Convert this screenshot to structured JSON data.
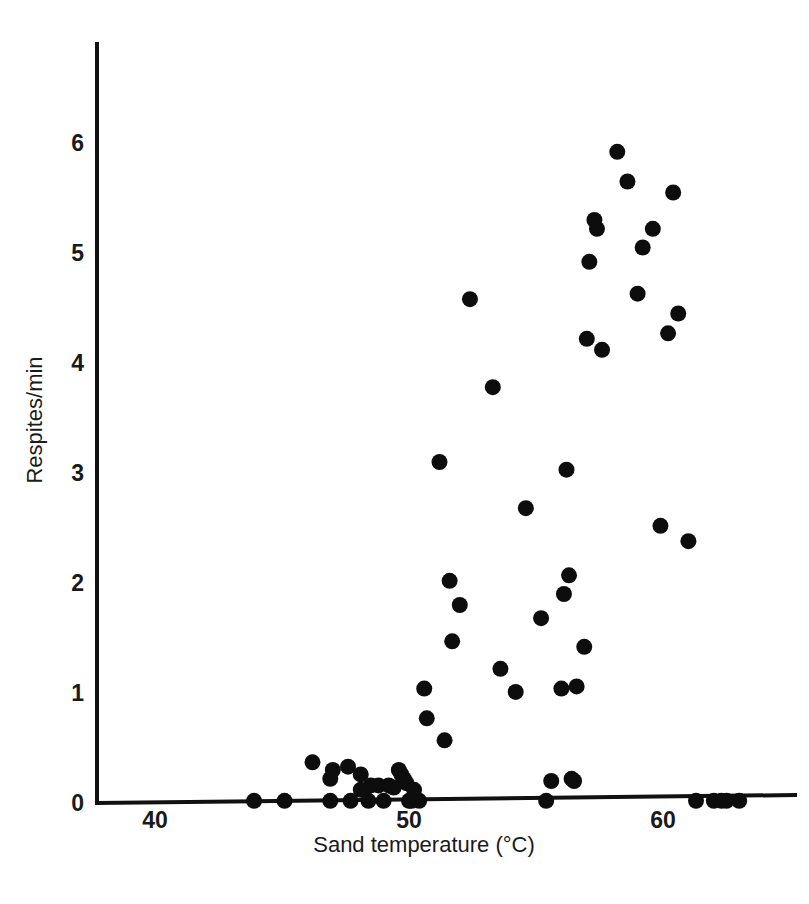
{
  "chart_data": {
    "type": "scatter",
    "title": "",
    "xlabel": "Sand temperature (°C)",
    "ylabel": "Respites/min",
    "xlim": [
      35.4,
      65.8
    ],
    "ylim": [
      -0.06,
      6.5
    ],
    "xticks": [
      40,
      50,
      60
    ],
    "xticklabels": [
      "40",
      "50",
      "60"
    ],
    "yticks": [
      0,
      1,
      2,
      3,
      4,
      5,
      6
    ],
    "yticklabels": [
      "0",
      "1",
      "2",
      "3",
      "4",
      "5",
      "6"
    ],
    "grid": false,
    "legend": null,
    "marker": {
      "shape": "circle",
      "color": "#0d0d0d",
      "size_px": 16
    },
    "x": [
      43.9,
      45.1,
      46.2,
      46.9,
      46.9,
      47.0,
      47.6,
      47.7,
      48.1,
      48.1,
      48.4,
      48.5,
      48.8,
      49.0,
      49.2,
      49.4,
      49.6,
      49.7,
      49.8,
      49.9,
      50.0,
      50.1,
      50.2,
      50.4,
      50.6,
      50.7,
      51.2,
      51.4,
      51.6,
      51.7,
      52.0,
      52.4,
      53.3,
      53.6,
      54.2,
      54.6,
      55.2,
      55.4,
      55.6,
      56.0,
      56.1,
      56.2,
      56.3,
      56.4,
      56.5,
      56.6,
      56.9,
      57.0,
      57.1,
      57.3,
      57.4,
      57.6,
      58.2,
      58.6,
      59.0,
      59.2,
      59.6,
      59.9,
      60.2,
      60.4,
      60.6,
      61.0,
      61.3,
      62.0,
      62.3,
      62.5,
      63.0
    ],
    "y": [
      0.02,
      0.02,
      0.37,
      0.22,
      0.02,
      0.3,
      0.33,
      0.02,
      0.26,
      0.12,
      0.02,
      0.16,
      0.16,
      0.02,
      0.16,
      0.14,
      0.3,
      0.26,
      0.22,
      0.18,
      0.02,
      0.02,
      0.12,
      0.02,
      1.04,
      0.77,
      3.1,
      0.57,
      2.02,
      1.47,
      1.8,
      4.58,
      3.78,
      1.22,
      1.01,
      2.68,
      1.68,
      0.02,
      0.2,
      1.04,
      1.9,
      3.03,
      2.07,
      0.22,
      0.2,
      1.06,
      1.42,
      4.22,
      4.92,
      5.3,
      5.22,
      4.12,
      5.92,
      5.65,
      4.63,
      5.05,
      5.22,
      2.52,
      4.27,
      5.55,
      4.45,
      2.38,
      0.02,
      0.02,
      0.02,
      0.02,
      0.02
    ],
    "points": [
      {
        "x": 43.9,
        "y": 0.02
      },
      {
        "x": 45.1,
        "y": 0.02
      },
      {
        "x": 46.2,
        "y": 0.37
      },
      {
        "x": 46.9,
        "y": 0.22
      },
      {
        "x": 46.9,
        "y": 0.02
      },
      {
        "x": 47.0,
        "y": 0.3
      },
      {
        "x": 47.6,
        "y": 0.33
      },
      {
        "x": 47.7,
        "y": 0.02
      },
      {
        "x": 48.1,
        "y": 0.26
      },
      {
        "x": 48.1,
        "y": 0.12
      },
      {
        "x": 48.4,
        "y": 0.02
      },
      {
        "x": 48.5,
        "y": 0.16
      },
      {
        "x": 48.8,
        "y": 0.16
      },
      {
        "x": 49.0,
        "y": 0.02
      },
      {
        "x": 49.2,
        "y": 0.16
      },
      {
        "x": 49.4,
        "y": 0.14
      },
      {
        "x": 49.6,
        "y": 0.3
      },
      {
        "x": 49.7,
        "y": 0.26
      },
      {
        "x": 49.8,
        "y": 0.22
      },
      {
        "x": 49.9,
        "y": 0.18
      },
      {
        "x": 50.0,
        "y": 0.02
      },
      {
        "x": 50.1,
        "y": 0.02
      },
      {
        "x": 50.2,
        "y": 0.12
      },
      {
        "x": 50.4,
        "y": 0.02
      },
      {
        "x": 50.6,
        "y": 1.04
      },
      {
        "x": 50.7,
        "y": 0.77
      },
      {
        "x": 51.2,
        "y": 3.1
      },
      {
        "x": 51.4,
        "y": 0.57
      },
      {
        "x": 51.6,
        "y": 2.02
      },
      {
        "x": 51.7,
        "y": 1.47
      },
      {
        "x": 52.0,
        "y": 1.8
      },
      {
        "x": 52.4,
        "y": 4.58
      },
      {
        "x": 53.3,
        "y": 3.78
      },
      {
        "x": 53.6,
        "y": 1.22
      },
      {
        "x": 54.2,
        "y": 1.01
      },
      {
        "x": 54.6,
        "y": 2.68
      },
      {
        "x": 55.2,
        "y": 1.68
      },
      {
        "x": 55.4,
        "y": 0.02
      },
      {
        "x": 55.6,
        "y": 0.2
      },
      {
        "x": 56.0,
        "y": 1.04
      },
      {
        "x": 56.1,
        "y": 1.9
      },
      {
        "x": 56.2,
        "y": 3.03
      },
      {
        "x": 56.3,
        "y": 2.07
      },
      {
        "x": 56.4,
        "y": 0.22
      },
      {
        "x": 56.5,
        "y": 0.2
      },
      {
        "x": 56.6,
        "y": 1.06
      },
      {
        "x": 56.9,
        "y": 1.42
      },
      {
        "x": 57.0,
        "y": 4.22
      },
      {
        "x": 57.1,
        "y": 4.92
      },
      {
        "x": 57.3,
        "y": 5.3
      },
      {
        "x": 57.4,
        "y": 5.22
      },
      {
        "x": 57.6,
        "y": 4.12
      },
      {
        "x": 58.2,
        "y": 5.92
      },
      {
        "x": 58.6,
        "y": 5.65
      },
      {
        "x": 59.0,
        "y": 4.63
      },
      {
        "x": 59.2,
        "y": 5.05
      },
      {
        "x": 59.6,
        "y": 5.22
      },
      {
        "x": 59.9,
        "y": 2.52
      },
      {
        "x": 60.2,
        "y": 4.27
      },
      {
        "x": 60.4,
        "y": 5.55
      },
      {
        "x": 60.6,
        "y": 4.45
      },
      {
        "x": 61.0,
        "y": 2.38
      },
      {
        "x": 61.3,
        "y": 0.02
      },
      {
        "x": 62.0,
        "y": 0.02
      },
      {
        "x": 62.3,
        "y": 0.02
      },
      {
        "x": 62.5,
        "y": 0.02
      },
      {
        "x": 63.0,
        "y": 0.02
      }
    ],
    "n_points": 67,
    "colors": {
      "marker": "#0d0d0d",
      "axis": "#111111",
      "text": "#1a1a1a",
      "background": "#ffffff"
    }
  },
  "geometry": {
    "x_pixel_at_40": 155,
    "x_pixel_at_60": 663,
    "y_pixel_at_0": 803,
    "y_pixel_per_unit": 110,
    "axis_origin_x": 97,
    "axis_top_y": 44,
    "axis_right_x": 795
  }
}
